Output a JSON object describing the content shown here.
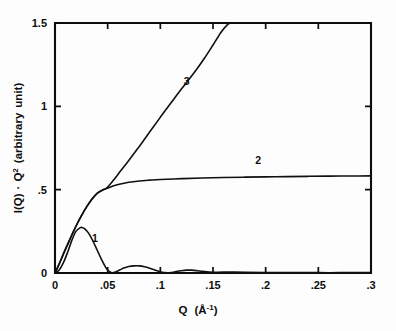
{
  "figure": {
    "name": "small-angle-scattering-plot",
    "background_color": "#fdfdfd",
    "ink_color": "#101010"
  },
  "chart_data": {
    "type": "line",
    "title": "",
    "subtitle": "",
    "xlabel": "Q  (Å⁻¹)",
    "ylabel": "I(Q) · Q² (arbitrary unit)",
    "xlim": [
      0,
      0.3
    ],
    "ylim": [
      0,
      1.5
    ],
    "grid": false,
    "legend_position": "inline-curve-labels",
    "xticks": [
      0,
      0.05,
      0.1,
      0.15,
      0.2,
      0.25,
      0.3
    ],
    "xtick_labels": [
      "0",
      ".05",
      ".1",
      ".15",
      ".2",
      ".25",
      ".3"
    ],
    "yticks": [
      0,
      0.5,
      1,
      1.5
    ],
    "ytick_labels": [
      "0",
      ".5",
      "1",
      "1.5"
    ],
    "annotations": [
      {
        "text": "1",
        "x": 0.038,
        "y": 0.185
      },
      {
        "text": "2",
        "x": 0.193,
        "y": 0.655
      },
      {
        "text": "3",
        "x": 0.125,
        "y": 1.13
      }
    ],
    "series": [
      {
        "name": "1",
        "label": "1",
        "description": "oscillating form factor, damped lobes",
        "x": [
          0.0,
          0.004,
          0.008,
          0.012,
          0.016,
          0.02,
          0.024,
          0.026,
          0.028,
          0.032,
          0.036,
          0.04,
          0.044,
          0.048,
          0.05,
          0.054,
          0.058,
          0.062,
          0.066,
          0.07,
          0.075,
          0.08,
          0.085,
          0.09,
          0.095,
          0.1,
          0.105,
          0.11,
          0.115,
          0.12,
          0.125,
          0.13,
          0.135,
          0.14,
          0.15,
          0.16,
          0.18,
          0.2,
          0.22,
          0.25,
          0.27,
          0.3
        ],
        "y": [
          0.0,
          0.018,
          0.062,
          0.125,
          0.196,
          0.251,
          0.272,
          0.272,
          0.266,
          0.238,
          0.192,
          0.138,
          0.083,
          0.035,
          0.018,
          0.002,
          0.008,
          0.02,
          0.031,
          0.039,
          0.043,
          0.043,
          0.038,
          0.029,
          0.018,
          0.008,
          0.002,
          0.003,
          0.009,
          0.014,
          0.017,
          0.017,
          0.014,
          0.01,
          0.004,
          0.006,
          0.004,
          0.003,
          0.003,
          0.002,
          0.002,
          0.002
        ]
      },
      {
        "name": "2",
        "label": "2",
        "description": "rises steeply then saturates to a plateau near 0.58",
        "x": [
          0.0,
          0.004,
          0.008,
          0.012,
          0.016,
          0.02,
          0.025,
          0.03,
          0.035,
          0.04,
          0.045,
          0.049,
          0.055,
          0.06,
          0.07,
          0.08,
          0.09,
          0.1,
          0.12,
          0.14,
          0.16,
          0.18,
          0.2,
          0.22,
          0.24,
          0.26,
          0.28,
          0.3
        ],
        "y": [
          0.0,
          0.055,
          0.115,
          0.172,
          0.228,
          0.282,
          0.343,
          0.397,
          0.443,
          0.478,
          0.497,
          0.507,
          0.522,
          0.531,
          0.544,
          0.552,
          0.557,
          0.561,
          0.566,
          0.57,
          0.573,
          0.575,
          0.577,
          0.578,
          0.58,
          0.581,
          0.582,
          0.583
        ]
      },
      {
        "name": "3",
        "label": "3",
        "description": "follows curve 2 at low Q then continues rising, exits top of axes near Q = 0.167",
        "x": [
          0.0,
          0.004,
          0.008,
          0.012,
          0.016,
          0.02,
          0.025,
          0.03,
          0.035,
          0.04,
          0.045,
          0.049,
          0.055,
          0.062,
          0.07,
          0.078,
          0.086,
          0.094,
          0.102,
          0.11,
          0.118,
          0.126,
          0.134,
          0.142,
          0.15,
          0.158,
          0.164,
          0.167
        ],
        "y": [
          0.0,
          0.055,
          0.115,
          0.172,
          0.228,
          0.282,
          0.343,
          0.397,
          0.443,
          0.478,
          0.497,
          0.51,
          0.553,
          0.61,
          0.675,
          0.742,
          0.812,
          0.882,
          0.952,
          1.02,
          1.088,
          1.152,
          1.218,
          1.29,
          1.368,
          1.448,
          1.492,
          1.5
        ]
      }
    ]
  }
}
